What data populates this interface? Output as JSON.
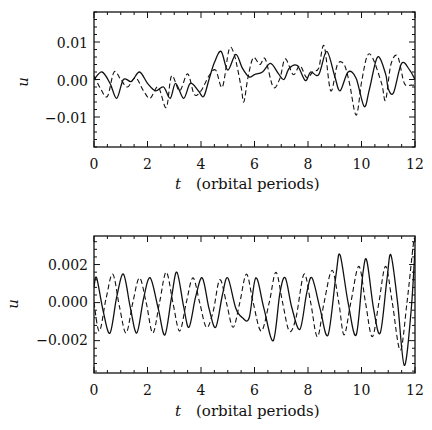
{
  "chart_data": [
    {
      "type": "line",
      "title": "",
      "xlabel_var": "t",
      "xlabel_unit": "(orbital periods)",
      "ylabel": "u",
      "xlim": [
        0,
        12
      ],
      "ylim": [
        -0.018,
        0.018
      ],
      "xticks": [
        0,
        2,
        4,
        6,
        8,
        10,
        12
      ],
      "xtick_labels": [
        "0",
        "2",
        "4",
        "6",
        "8",
        "10",
        "12"
      ],
      "yticks": [
        0.01,
        0.0,
        -0.01
      ],
      "ytick_labels": [
        "0.01",
        "0.00",
        "−0.01"
      ],
      "grid": false,
      "legend": "none",
      "series": [
        {
          "name": "solid",
          "style": "solid",
          "x": [
            0,
            0.3,
            0.6,
            0.85,
            1.1,
            1.4,
            1.7,
            2.0,
            2.3,
            2.6,
            2.85,
            3.05,
            3.35,
            3.6,
            3.9,
            4.1,
            4.3,
            4.5,
            4.75,
            5.0,
            5.3,
            5.55,
            5.8,
            6.0,
            6.3,
            6.6,
            6.9,
            7.1,
            7.3,
            7.6,
            7.9,
            8.1,
            8.4,
            8.7,
            9.0,
            9.2,
            9.5,
            9.8,
            10.1,
            10.3,
            10.6,
            10.9,
            11.0,
            11.2,
            11.5,
            11.8,
            12.0
          ],
          "values": [
            0.0,
            0.002,
            -0.001,
            -0.005,
            0.0,
            -0.0005,
            0.002,
            -0.001,
            -0.003,
            -0.002,
            -0.005,
            -0.001,
            -0.005,
            -0.001,
            -0.003,
            -0.0045,
            0.0,
            0.0045,
            0.0075,
            0.0025,
            0.0067,
            0.003,
            0.0007,
            0.0013,
            0.002,
            0.0043,
            0.0015,
            0.0,
            0.003,
            0.0037,
            -0.0003,
            0.002,
            0.0013,
            0.0075,
            0.0008,
            -0.003,
            0.002,
            0.0003,
            -0.0072,
            -0.0025,
            0.006,
            0.0015,
            -0.0025,
            -0.0035,
            0.0043,
            0.0025,
            0.0
          ]
        },
        {
          "name": "dashed",
          "style": "dashed",
          "x": [
            0,
            0.25,
            0.5,
            0.75,
            1.0,
            1.25,
            1.55,
            1.85,
            2.1,
            2.4,
            2.7,
            2.9,
            3.2,
            3.5,
            3.75,
            4.0,
            4.3,
            4.55,
            4.8,
            5.05,
            5.25,
            5.5,
            5.6,
            5.75,
            5.95,
            6.2,
            6.4,
            6.7,
            6.95,
            7.15,
            7.45,
            7.7,
            7.95,
            8.2,
            8.4,
            8.6,
            8.85,
            9.1,
            9.35,
            9.55,
            9.8,
            10.0,
            10.2,
            10.4,
            10.75,
            10.9,
            11.1,
            11.35,
            11.6,
            11.85,
            12.0
          ],
          "values": [
            0.001,
            -0.0025,
            -0.0045,
            0.002,
            0.0,
            -0.002,
            0.0005,
            -0.003,
            -0.005,
            -0.002,
            -0.0075,
            0.001,
            -0.003,
            0.0015,
            -0.004,
            -0.003,
            0.001,
            0.0025,
            -0.002,
            0.008,
            0.0065,
            -0.002,
            -0.006,
            0.0003,
            0.0058,
            0.004,
            0.0055,
            -0.002,
            0.0003,
            0.0055,
            0.0013,
            0.0037,
            0.0005,
            0.0022,
            0.003,
            0.009,
            -0.003,
            0.004,
            0.004,
            -0.001,
            -0.0095,
            -0.0008,
            0.006,
            0.006,
            -0.001,
            -0.0055,
            0.004,
            0.0062,
            -0.001,
            -0.0015,
            -0.0015
          ]
        }
      ]
    },
    {
      "type": "line",
      "title": "",
      "xlabel_var": "t",
      "xlabel_unit": "(orbital periods)",
      "ylabel": "u",
      "xlim": [
        0,
        12
      ],
      "ylim": [
        -0.0037,
        0.0035
      ],
      "xticks": [
        0,
        2,
        4,
        6,
        8,
        10,
        12
      ],
      "xtick_labels": [
        "0",
        "2",
        "4",
        "6",
        "8",
        "10",
        "12"
      ],
      "yticks": [
        0.002,
        0.0,
        -0.002
      ],
      "ytick_labels": [
        "0.002",
        "0.000",
        "−0.002"
      ],
      "grid": false,
      "legend": "none",
      "series": [
        {
          "name": "solid",
          "style": "solid",
          "x": [
            0,
            0.1,
            0.35,
            0.6,
            0.85,
            1.1,
            1.35,
            1.6,
            1.85,
            2.1,
            2.4,
            2.65,
            2.9,
            3.1,
            3.35,
            3.55,
            3.8,
            4.05,
            4.3,
            4.55,
            4.8,
            5.0,
            5.3,
            5.55,
            5.8,
            6.05,
            6.35,
            6.7,
            6.95,
            7.15,
            7.4,
            7.7,
            7.95,
            8.15,
            8.45,
            8.75,
            9.05,
            9.2,
            9.5,
            9.8,
            10.05,
            10.2,
            10.45,
            10.7,
            10.95,
            11.1,
            11.35,
            11.6,
            11.85,
            12.0
          ],
          "values": [
            0.0008,
            0.0013,
            -0.0005,
            -0.0016,
            0.0003,
            0.0015,
            -0.0002,
            -0.0016,
            0.0002,
            0.0013,
            -0.0003,
            -0.0017,
            0.0003,
            0.0016,
            -0.0002,
            -0.0013,
            0.0003,
            0.0013,
            -0.0003,
            -0.0013,
            0.0004,
            0.0013,
            -0.0003,
            -0.0008,
            -0.0008,
            0.0013,
            -0.0003,
            -0.002,
            0.0005,
            0.0013,
            -0.0003,
            -0.0014,
            0.0005,
            0.0013,
            -0.0003,
            -0.0017,
            0.0015,
            0.0025,
            0.0,
            -0.0017,
            0.0015,
            0.0022,
            -0.0003,
            -0.0016,
            0.0012,
            0.0025,
            0.0,
            -0.0033,
            -0.0005,
            0.0028
          ]
        },
        {
          "name": "dashed",
          "style": "dashed",
          "x": [
            0,
            0.2,
            0.45,
            0.7,
            0.95,
            1.2,
            1.45,
            1.7,
            1.95,
            2.2,
            2.45,
            2.7,
            2.95,
            3.2,
            3.45,
            3.7,
            3.95,
            4.2,
            4.45,
            4.7,
            4.95,
            5.2,
            5.45,
            5.7,
            5.95,
            6.25,
            6.55,
            6.8,
            7.05,
            7.3,
            7.55,
            7.85,
            8.1,
            8.35,
            8.6,
            8.9,
            9.15,
            9.35,
            9.6,
            9.9,
            10.15,
            10.4,
            10.65,
            10.9,
            11.15,
            11.45,
            11.7,
            11.95,
            12.0
          ],
          "values": [
            0.0,
            -0.0015,
            0.0002,
            0.0015,
            -0.0002,
            -0.0016,
            0.0,
            0.0013,
            0.0,
            -0.0016,
            0.0,
            0.0016,
            0.0,
            -0.0015,
            0.0,
            0.0013,
            0.0,
            -0.0013,
            -0.0005,
            0.0012,
            0.0,
            -0.0013,
            0.0,
            0.0015,
            0.0,
            -0.0015,
            0.0,
            0.0016,
            0.0,
            -0.0015,
            -0.0008,
            0.0015,
            0.0,
            -0.0018,
            0.0,
            0.0017,
            0.0,
            -0.0017,
            0.0,
            0.0019,
            0.0,
            -0.0018,
            0.0,
            0.0019,
            0.0,
            -0.0025,
            0.0,
            0.0032,
            0.003
          ]
        }
      ]
    }
  ],
  "panels": [
    {
      "ylabel": "u",
      "ytick_labels": [
        "0.01",
        "0.00",
        "−0.01"
      ],
      "xtick_labels": [
        "0",
        "2",
        "4",
        "6",
        "8",
        "10",
        "12"
      ],
      "xlabel_var": "t",
      "xlabel_unit": "(orbital periods)"
    },
    {
      "ylabel": "u",
      "ytick_labels": [
        "0.002",
        "0.000",
        "−0.002"
      ],
      "xtick_labels": [
        "0",
        "2",
        "4",
        "6",
        "8",
        "10",
        "12"
      ],
      "xlabel_var": "t",
      "xlabel_unit": "(orbital periods)"
    }
  ]
}
